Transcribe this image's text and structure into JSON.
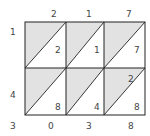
{
  "diagram": {
    "type": "lattice-multiplication",
    "top_digits": [
      "2",
      "1",
      "7"
    ],
    "left_digits": [
      "1",
      "4"
    ],
    "cells": [
      [
        {
          "tens": "",
          "ones": "2"
        },
        {
          "tens": "",
          "ones": "1"
        },
        {
          "tens": "",
          "ones": "7"
        }
      ],
      [
        {
          "tens": "",
          "ones": "8"
        },
        {
          "tens": "",
          "ones": "4"
        },
        {
          "tens": "2",
          "ones": "8"
        }
      ]
    ],
    "result_left": "3",
    "result_bottom": [
      "0",
      "3",
      "8"
    ],
    "colors": {
      "shade": "#e2e2e2",
      "line": "#222222",
      "text": "#444444"
    }
  }
}
